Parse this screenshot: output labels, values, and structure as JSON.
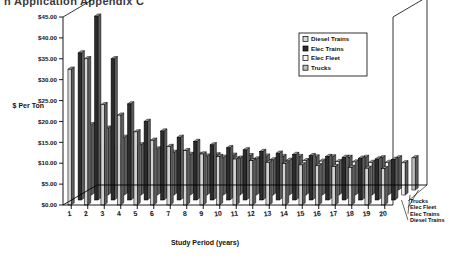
{
  "title_clipped": "n Application Appendix C",
  "axis": {
    "ylabel": "$ Per Ton",
    "xlabel": "Study Period (years)",
    "yticks": [
      "$0.00",
      "$5.00",
      "$10.00",
      "$15.00",
      "$20.00",
      "$25.00",
      "$30.00",
      "$35.00",
      "$40.00",
      "$45.00"
    ],
    "xticks": [
      "1",
      "2",
      "3",
      "4",
      "5",
      "6",
      "7",
      "8",
      "9",
      "10",
      "11",
      "12",
      "13",
      "14",
      "15",
      "16",
      "17",
      "18",
      "19",
      "20"
    ]
  },
  "legend": {
    "position": "top-right",
    "items": [
      {
        "label": "Diesel Trains",
        "swatch": "#d8d8d8"
      },
      {
        "label": "Elec Trains",
        "swatch": "#2b2b2b"
      },
      {
        "label": "Elec Fleet",
        "swatch": "#f4f4f4"
      },
      {
        "label": "Trucks",
        "swatch": "#bdbdbd"
      }
    ]
  },
  "depth_labels": [
    "Trucks",
    "Elec Fleet",
    "Elec Trains",
    "Diesel Trains"
  ],
  "chart_data": {
    "type": "bar",
    "title": "n Application Appendix C",
    "xlabel": "Study Period (years)",
    "ylabel": "$ Per Ton",
    "ylim": [
      0,
      45
    ],
    "ytick_step": 5,
    "grid": false,
    "legend_position": "top-right",
    "categories": [
      "1",
      "2",
      "3",
      "4",
      "5",
      "6",
      "7",
      "8",
      "9",
      "10",
      "11",
      "12",
      "13",
      "14",
      "15",
      "16",
      "17",
      "18",
      "19",
      "20"
    ],
    "series": [
      {
        "name": "Diesel Trains",
        "color": "#d4d4d4",
        "values": [
          32.5,
          35.0,
          24.0,
          21.5,
          17.5,
          15.5,
          14.0,
          13.0,
          12.2,
          11.6,
          11.0,
          10.6,
          10.2,
          9.9,
          9.6,
          9.4,
          9.2,
          9.0,
          8.8,
          8.7
        ]
      },
      {
        "name": "Elec Trains",
        "color": "#2b2b2b",
        "values": [
          35.2,
          44.0,
          33.8,
          23.0,
          18.8,
          16.5,
          15.0,
          14.0,
          13.2,
          12.5,
          12.0,
          11.6,
          11.2,
          10.9,
          10.6,
          10.4,
          10.2,
          10.0,
          9.8,
          9.7
        ]
      },
      {
        "name": "Elec Fleet",
        "color": "#f2f2f2",
        "values": [
          16.8,
          16.0,
          13.8,
          12.0,
          11.0,
          10.2,
          9.7,
          9.3,
          9.0,
          8.8,
          8.6,
          8.4,
          8.3,
          8.2,
          8.1,
          8.0,
          7.9,
          7.8,
          7.8,
          7.7
        ]
      },
      {
        "name": "Trucks",
        "color": "#bdbdbd",
        "values": [
          10.4,
          10.2,
          9.6,
          9.2,
          8.9,
          8.7,
          8.5,
          8.4,
          8.3,
          8.2,
          8.1,
          8.0,
          8.0,
          7.9,
          7.9,
          7.8,
          7.8,
          7.7,
          7.7,
          7.7
        ]
      }
    ]
  }
}
